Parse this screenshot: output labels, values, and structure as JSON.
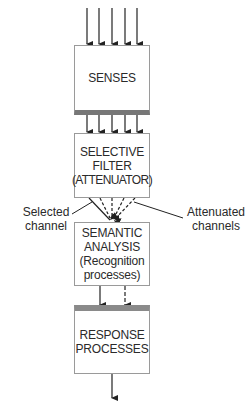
{
  "diagram": {
    "boxes": {
      "senses": [
        "SENSES"
      ],
      "filter": [
        "SELECTIVE",
        "FILTER",
        "(ATTENUATOR)"
      ],
      "semantic": [
        "SEMANTIC",
        "ANALYSIS",
        "(Recognition",
        "processes)"
      ],
      "response": [
        "RESPONSE",
        "PROCESSES"
      ]
    },
    "labels": {
      "selected": [
        "Selected",
        "channel"
      ],
      "attenuated": [
        "Attenuated",
        "channels"
      ]
    },
    "colors": {
      "line": "#222222",
      "border": "#9a9a9a",
      "shade": "#808080"
    }
  }
}
